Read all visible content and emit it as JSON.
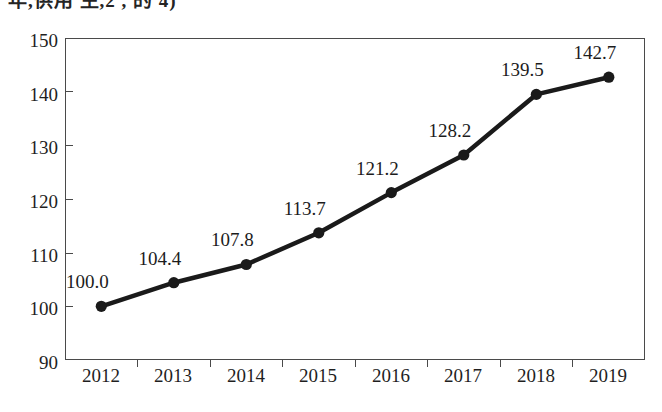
{
  "chart_data": {
    "type": "line",
    "title": "",
    "title_cropped": true,
    "subtitle": "",
    "xlabel": "",
    "ylabel": "",
    "categories": [
      "2012",
      "2013",
      "2014",
      "2015",
      "2016",
      "2017",
      "2018",
      "2019"
    ],
    "values": [
      100.0,
      104.4,
      107.8,
      113.7,
      121.2,
      128.2,
      139.5,
      142.7
    ],
    "data_labels": [
      "100.0",
      "104.4",
      "107.8",
      "113.7",
      "121.2",
      "128.2",
      "139.5",
      "142.7"
    ],
    "series": [
      {
        "name": "",
        "values": [
          100.0,
          104.4,
          107.8,
          113.7,
          121.2,
          128.2,
          139.5,
          142.7
        ]
      }
    ],
    "ylim": [
      90,
      150
    ],
    "ytick_step": 10,
    "ytick_labels": [
      "150",
      "140",
      "130",
      "120",
      "110",
      "100",
      "90"
    ],
    "ytick_values": [
      150,
      140,
      130,
      120,
      110,
      100,
      90
    ],
    "grid": false,
    "legend": false,
    "legend_position": "none",
    "marker": "circle",
    "marker_filled": true,
    "line_color": "#1a1a1a",
    "marker_color": "#1a1a1a",
    "axis_color": "#4a4a4a",
    "text_color": "#1f1f1f",
    "background_color": "#ffffff",
    "annotations": []
  },
  "chart": {
    "title_fragment": "年,供用 生,2 , 的 4)"
  }
}
